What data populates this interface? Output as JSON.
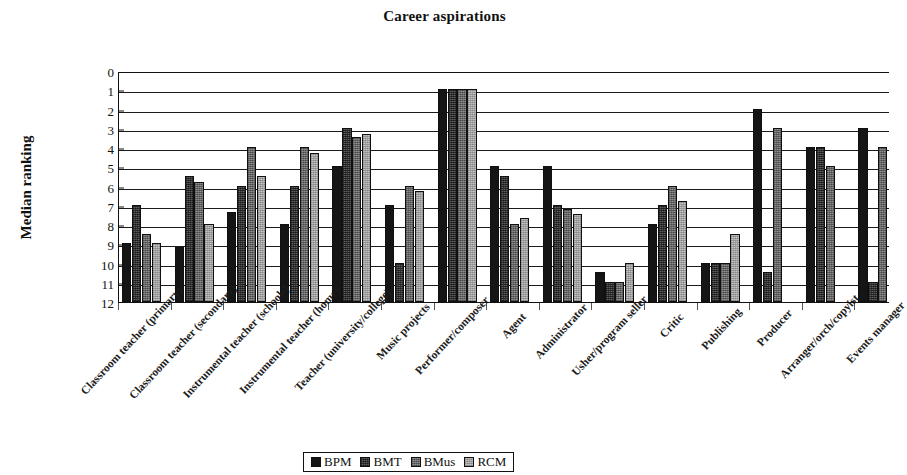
{
  "chart_data": {
    "type": "bar",
    "title": "Career aspirations",
    "xlabel": "",
    "ylabel": "Median ranking",
    "ylim": [
      0,
      12
    ],
    "y_inverted": true,
    "y_ticks": [
      0,
      1,
      2,
      3,
      4,
      5,
      6,
      7,
      8,
      9,
      10,
      11,
      12
    ],
    "grid": true,
    "legend_position": "bottom",
    "note": "Plot area is clipped at the right edge of the screenshot; the last group is partially cut off.",
    "categories": [
      "Classroom teacher (primary)",
      "Classroom teacher (secondary)",
      "Instrumental teacher (schools)",
      "Instrumental teacher (home)",
      "Teacher (university/college)",
      "Music projects",
      "Performer/composer",
      "Agent",
      "Administrator",
      "Usher/program seller",
      "Critic",
      "Publishing",
      "Producer",
      "Arranger/orch/copyist",
      "Events manager"
    ],
    "series": [
      {
        "name": "BPM",
        "color": "#151515",
        "values": [
          9.0,
          9.2,
          7.4,
          8.0,
          5.0,
          7.0,
          1.0,
          5.0,
          5.0,
          10.5,
          8.0,
          10.0,
          2.0,
          4.0,
          3.0
        ]
      },
      {
        "name": "BMT",
        "color": "#5d5d5d",
        "values": [
          7.0,
          5.5,
          6.0,
          6.0,
          3.0,
          10.0,
          1.0,
          5.5,
          7.0,
          11.0,
          7.0,
          10.0,
          10.5,
          4.0,
          11.0
        ]
      },
      {
        "name": "BMus",
        "color": "#8e8e8e",
        "values": [
          8.5,
          5.8,
          4.0,
          4.0,
          3.5,
          6.0,
          1.0,
          8.0,
          7.2,
          11.0,
          6.0,
          10.0,
          3.0,
          5.0,
          4.0
        ]
      },
      {
        "name": "RCM",
        "color": "#c2c2c2",
        "values": [
          9.0,
          8.0,
          5.5,
          4.3,
          3.3,
          6.3,
          1.0,
          7.7,
          7.5,
          10.0,
          6.8,
          8.5,
          null,
          null,
          null
        ]
      }
    ]
  },
  "legend": {
    "items": [
      {
        "label": "BPM"
      },
      {
        "label": "BMT"
      },
      {
        "label": "BMus"
      },
      {
        "label": "RCM"
      }
    ]
  }
}
